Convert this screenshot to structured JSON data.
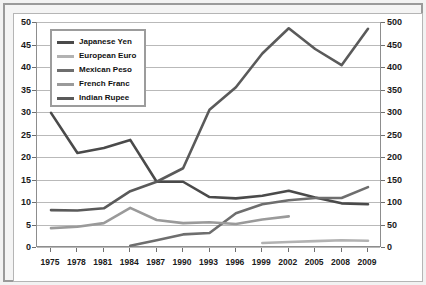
{
  "chart_data": {
    "type": "line",
    "title": "",
    "subtitle": "",
    "xlabel": "",
    "ylabel": "",
    "categories": [
      "1975",
      "1978",
      "1981",
      "1984",
      "1987",
      "1990",
      "1993",
      "1996",
      "1999",
      "2002",
      "2005",
      "2008",
      "2009"
    ],
    "axes": {
      "left": {
        "label": "",
        "min": 0,
        "max": 50,
        "step": 5,
        "ticks": [
          "0",
          "5",
          "10",
          "15",
          "20",
          "25",
          "30",
          "35",
          "40",
          "45",
          "50"
        ]
      },
      "right": {
        "label": "",
        "min": 0,
        "max": 500,
        "step": 50,
        "ticks": [
          "0",
          "50",
          "100",
          "150",
          "200",
          "250",
          "300",
          "350",
          "400",
          "450",
          "500"
        ]
      }
    },
    "grid": true,
    "legend_position": "top-left",
    "series": [
      {
        "name": "Japanese Yen",
        "axis": "right",
        "color": "#4a4a4a",
        "x": [
          "1975",
          "1978",
          "1981",
          "1984",
          "1987",
          "1990",
          "1993",
          "1996",
          "1999",
          "2002",
          "2005",
          "2008",
          "2009"
        ],
        "values": [
          298,
          209,
          220,
          238,
          145,
          145,
          111,
          108,
          114,
          125,
          110,
          97,
          95
        ]
      },
      {
        "name": "European Euro",
        "axis": "left",
        "color": "#b2b2b2",
        "x": [
          "1999",
          "2002",
          "2005",
          "2008",
          "2009"
        ],
        "values": [
          0.9,
          1.1,
          1.3,
          1.5,
          1.4
        ]
      },
      {
        "name": "Mexican Peso",
        "axis": "left",
        "color": "#6e6e6e",
        "x": [
          "1984",
          "1987",
          "1990",
          "1993",
          "1996",
          "1999",
          "2002",
          "2005",
          "2008",
          "2009"
        ],
        "values": [
          0.3,
          1.5,
          2.8,
          3.1,
          7.5,
          9.5,
          10.4,
          10.9,
          10.9,
          13.3
        ]
      },
      {
        "name": "French Franc",
        "axis": "left",
        "color": "#9a9a9a",
        "x": [
          "1975",
          "1978",
          "1981",
          "1984",
          "1987",
          "1990",
          "1993",
          "1996",
          "1999",
          "2002"
        ],
        "values": [
          4.2,
          4.5,
          5.3,
          8.7,
          6.0,
          5.3,
          5.5,
          5.1,
          6.1,
          6.8
        ]
      },
      {
        "name": "Indian Rupee",
        "axis": "left",
        "color": "#5a5a5a",
        "x": [
          "1975",
          "1978",
          "1981",
          "1984",
          "1987",
          "1990",
          "1993",
          "1996",
          "1999",
          "2002",
          "2005",
          "2008",
          "2009"
        ],
        "values": [
          8.2,
          8.1,
          8.6,
          12.4,
          14.5,
          17.5,
          30.5,
          35.5,
          43.0,
          48.6,
          44.0,
          40.4,
          48.5
        ]
      }
    ]
  },
  "legend": {
    "items": [
      {
        "label": "Japanese Yen",
        "color": "#4a4a4a"
      },
      {
        "label": "European Euro",
        "color": "#b2b2b2"
      },
      {
        "label": "Mexican Peso",
        "color": "#6e6e6e"
      },
      {
        "label": "French Franc",
        "color": "#9a9a9a"
      },
      {
        "label": "Indian Rupee",
        "color": "#5a5a5a"
      }
    ]
  }
}
